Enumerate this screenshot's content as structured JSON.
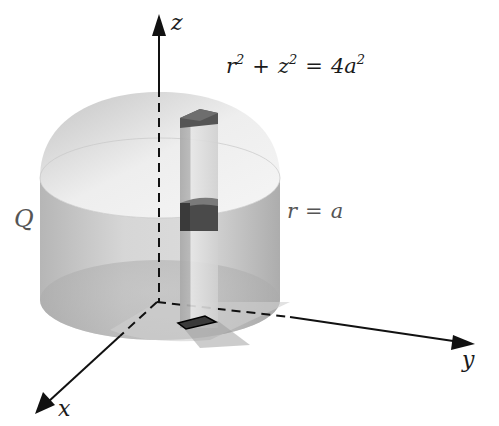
{
  "diagram": {
    "type": "3d-solid-cylinder-with-integration-column",
    "colors": {
      "background": "#ffffff",
      "cylinder_side": "#bdbdbd",
      "cylinder_top": "#e0e0e0",
      "column": "#d6d6d6",
      "volume_element": "#4a4a4a",
      "axis": "#111111",
      "label_text": "#1a1a1a"
    },
    "axes": {
      "z": {
        "label": "z"
      },
      "y": {
        "label": "y"
      },
      "x": {
        "label": "x"
      }
    },
    "labels": {
      "region": "Q",
      "sphere_eq": {
        "lhs1_base": "r",
        "lhs1_exp": "2",
        "plus": "+",
        "lhs2_base": "z",
        "lhs2_exp": "2",
        "equals": "=",
        "rhs_base": "4a",
        "rhs_exp": "2"
      },
      "cylinder_eq": {
        "lhs": "r",
        "equals": "=",
        "rhs": "a"
      }
    }
  }
}
